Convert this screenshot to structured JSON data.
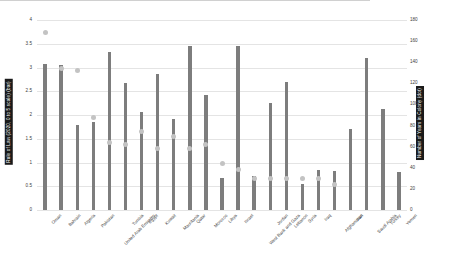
{
  "chart_data": {
    "type": "bar",
    "title": "",
    "xlabel": "",
    "ylabel": "Rule of Law (2020, 0 to 5 scale) (bar)",
    "y2label": "Number of Years in Colony (dot)",
    "ylim": [
      0,
      4
    ],
    "y2lim": [
      0,
      180
    ],
    "yticks": [
      "0",
      "0.5",
      "1",
      "1.5",
      "2",
      "2.5",
      "3",
      "3.5",
      "4"
    ],
    "y2ticks": [
      "0",
      "20",
      "40",
      "60",
      "80",
      "100",
      "120",
      "140",
      "160",
      "180"
    ],
    "grid": true,
    "legend": "none",
    "categories": [
      "Oman",
      "Bahrain",
      "Algeria",
      "Pakistan",
      "United Arab Emirates",
      "Tunisia",
      "Egypt",
      "Kuwait",
      "Mauritania",
      "Qatar",
      "Morocco",
      "Libya",
      "Israel",
      "West Bank and Gaza",
      "Jordan",
      "Lebanon",
      "Syria",
      "Iraq",
      "Afghanistan",
      "Iran",
      "Saudi Arabia",
      "Turkey",
      "Yemen"
    ],
    "series": [
      {
        "name": "Rule of Law (2020, 0 to 5 scale)",
        "type": "bar",
        "axis": "left",
        "color": "#7d7d7d",
        "values": [
          3.08,
          3.05,
          1.78,
          1.86,
          3.33,
          2.68,
          2.07,
          2.86,
          1.92,
          3.45,
          2.42,
          0.67,
          3.45,
          0.72,
          2.25,
          2.7,
          0.55,
          0.85,
          0.83,
          1.7,
          3.2,
          2.12,
          0.8
        ]
      },
      {
        "name": "Number of Years in Colony",
        "type": "scatter",
        "axis": "right",
        "color": "#c3c3c3",
        "values": [
          168,
          134,
          132,
          88,
          64,
          62,
          74,
          58,
          70,
          58,
          62,
          44,
          38,
          30,
          30,
          30,
          30,
          30,
          24,
          null,
          null,
          null,
          null
        ]
      }
    ]
  }
}
